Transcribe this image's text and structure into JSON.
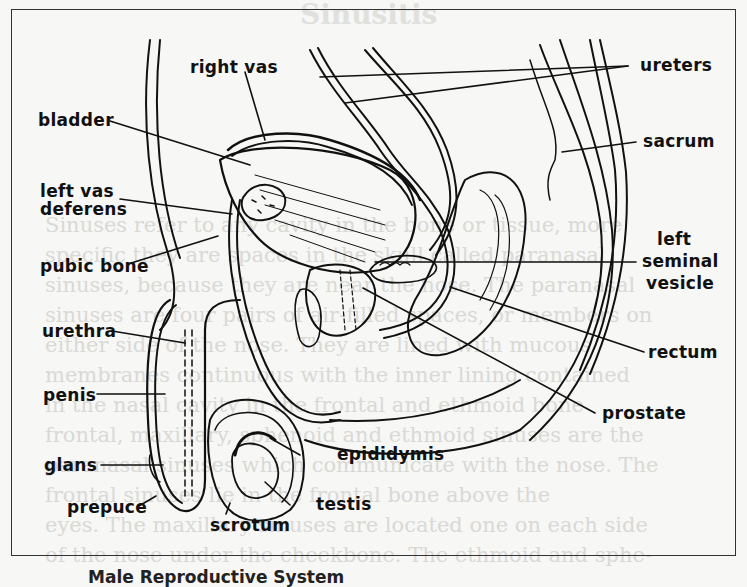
{
  "figure": {
    "caption": "Male Reproductive System",
    "background_page_title": "Sinusitis",
    "labels": {
      "right_vas": "right vas",
      "ureters": "ureters",
      "bladder": "bladder",
      "sacrum": "sacrum",
      "left_vas_deferens_1": "left vas",
      "left_vas_deferens_2": "deferens",
      "pubic_bone": "pubic bone",
      "left_seminal_vesicle_1": "left",
      "left_seminal_vesicle_2": "seminal",
      "left_seminal_vesicle_3": "vesicle",
      "urethra": "urethra",
      "rectum": "rectum",
      "penis": "penis",
      "prostate": "prostate",
      "epididymis": "epididymis",
      "glans": "glans",
      "testis": "testis",
      "prepuce": "prepuce",
      "scrotum": "scrotum"
    },
    "colors": {
      "ink": "#111111",
      "paper": "#f7f7f5",
      "bleed_text": "#d9d9d6"
    }
  },
  "bleed_text": [
    "Sinuses refer to any cavity in the bone or tissue, more",
    "specific they are spaces in the skull called paranasal",
    "sinuses, because they are near the nose. The paranasal",
    "sinuses are four pairs of air-filled spaces, or members on",
    "either side of the nose. They are lined with mucous",
    "membranes continuous with the inner lining contained",
    "in the nasal cavity in the frontal and ethmoid bone",
    "frontal, maxillary, sphenoid and ethmoid sinuses are the",
    "paranasal sinuses which communicate with the nose. The",
    "frontal sinuses lie in the frontal bone above the",
    "eyes. The maxillary sinuses are located one on each side",
    "of the nose under the cheekbone. The ethmoid and sphe-"
  ]
}
